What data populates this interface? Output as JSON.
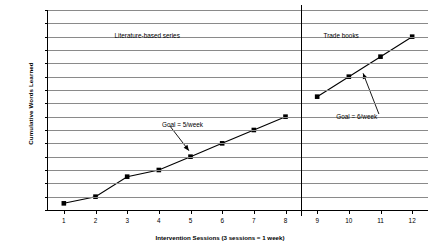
{
  "chart_data": {
    "type": "line",
    "title": "",
    "xlabel": "Intervention Sessions (3 sessions = 1 week)",
    "ylabel": "Cumulative Words Learned",
    "xlim": [
      0.5,
      12.5
    ],
    "ylim": [
      0,
      30
    ],
    "ytick_step": 2,
    "grid": true,
    "legend": "none",
    "x": [
      1,
      2,
      3,
      4,
      5,
      6,
      7,
      8,
      9,
      10,
      11,
      12
    ],
    "xticklabels": [
      "1",
      "2",
      "3",
      "4",
      "5",
      "6",
      "7",
      "8",
      "9",
      "10",
      "11",
      "12"
    ],
    "yticklabels": [
      "0",
      "2",
      "4",
      "6",
      "8",
      "10",
      "12",
      "14",
      "16",
      "18",
      "20",
      "22",
      "24",
      "26",
      "28",
      "30"
    ],
    "series": [
      {
        "name": "Literature-based series",
        "x": [
          1,
          2,
          3,
          4,
          5,
          6,
          7,
          8
        ],
        "values": [
          1,
          2,
          5,
          6,
          8,
          10,
          12,
          14
        ],
        "marker": "square",
        "color": "#000000"
      },
      {
        "name": "Trade books",
        "x": [
          9,
          10,
          11,
          12
        ],
        "values": [
          17,
          20,
          23,
          26
        ],
        "marker": "square",
        "color": "#000000"
      }
    ],
    "phase_labels": [
      {
        "text": "Literature-based series",
        "x": 2.6,
        "y": 26.7
      },
      {
        "text": "Trade books",
        "x": 9.2,
        "y": 26.7
      }
    ],
    "phase_divider": {
      "x": 8.5
    },
    "annotations": [
      {
        "text": "Goal = 5/week",
        "text_x": 4.1,
        "text_y": 13.4,
        "arrow_from_x": 4.35,
        "arrow_from_y": 12.6,
        "arrow_to_x": 4.95,
        "arrow_to_y": 8.9
      },
      {
        "text": "Goal = 6/week",
        "text_x": 9.6,
        "text_y": 14.5,
        "arrow_from_x": 10.95,
        "arrow_from_y": 14.4,
        "arrow_to_x": 10.45,
        "arrow_to_y": 20.5
      }
    ]
  }
}
